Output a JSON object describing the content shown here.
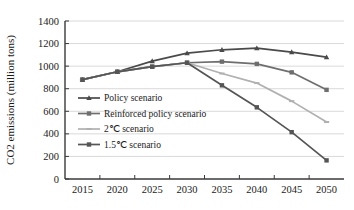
{
  "chart_data": {
    "type": "line",
    "title": "",
    "xlabel": "",
    "ylabel": "CO2 emissions (million tons)",
    "x": [
      2015,
      2020,
      2025,
      2030,
      2035,
      2040,
      2045,
      2050
    ],
    "xtick_labels": [
      "2015",
      "2020",
      "2025",
      "2030",
      "2035",
      "2040",
      "2045",
      "2050"
    ],
    "ytick_labels": [
      "0",
      "200",
      "400",
      "600",
      "800",
      "1000",
      "1200",
      "1400"
    ],
    "ytick_values": [
      0,
      200,
      400,
      600,
      800,
      1000,
      1200,
      1400
    ],
    "ylim": [
      0,
      1400
    ],
    "grid": "horizontal",
    "legend_position": "inside-left",
    "series": [
      {
        "name": "Policy scenario",
        "color": "#4a4a4a",
        "marker": "triangle",
        "values": [
          880,
          950,
          1045,
          1115,
          1145,
          1160,
          1125,
          1080
        ]
      },
      {
        "name": "Reinforced policy scenario",
        "color": "#6e6e6e",
        "marker": "square",
        "values": [
          880,
          950,
          995,
          1030,
          1040,
          1020,
          945,
          790
        ]
      },
      {
        "name": "2℃ scenario",
        "color": "#b0b0b0",
        "marker": "dash",
        "values": [
          880,
          950,
          995,
          1030,
          935,
          850,
          690,
          505
        ]
      },
      {
        "name": "1.5℃ scenario",
        "color": "#555555",
        "marker": "square",
        "values": [
          880,
          950,
          995,
          1030,
          830,
          635,
          415,
          165
        ]
      }
    ]
  },
  "legend": {
    "entries": [
      {
        "label": "Policy scenario"
      },
      {
        "label": "Reinforced policy scenario"
      },
      {
        "label": "2℃ scenario"
      },
      {
        "label": "1.5℃ scenario"
      }
    ]
  }
}
